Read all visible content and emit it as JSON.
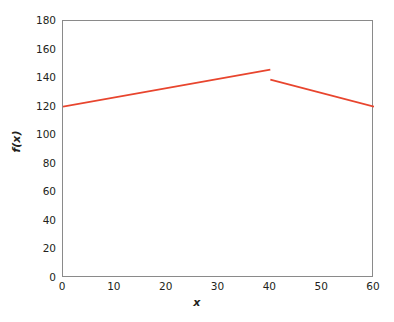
{
  "chart_data": {
    "type": "line",
    "title": "",
    "xlabel": "x",
    "ylabel": "f(x)",
    "xlim": [
      0,
      60
    ],
    "ylim": [
      0,
      180
    ],
    "xticks": [
      0,
      10,
      20,
      30,
      40,
      50,
      60
    ],
    "yticks": [
      0,
      20,
      40,
      60,
      80,
      100,
      120,
      140,
      160,
      180
    ],
    "grid": false,
    "legend": null,
    "line_color": "#e8452e",
    "axis_color": "#8a8a8a",
    "background": "#ffffff",
    "discontinuity_at_x": 40,
    "series": [
      {
        "name": "f(x) segment 1",
        "x": [
          0,
          40
        ],
        "values": [
          120,
          146
        ]
      },
      {
        "name": "f(x) segment 2",
        "x": [
          40,
          60
        ],
        "values": [
          139,
          120
        ]
      }
    ],
    "tick_labels": {
      "x": [
        "0",
        "10",
        "20",
        "30",
        "40",
        "50",
        "60"
      ],
      "y": [
        "0",
        "20",
        "40",
        "60",
        "80",
        "100",
        "120",
        "140",
        "160",
        "180"
      ]
    }
  }
}
